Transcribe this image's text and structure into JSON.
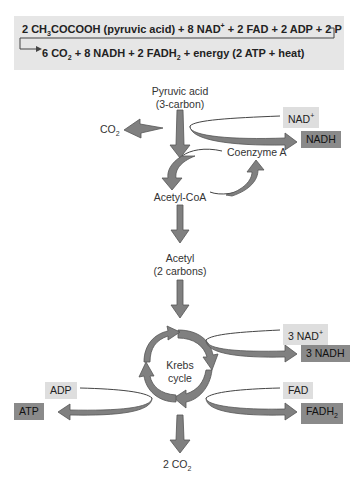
{
  "equation": {
    "line1": {
      "prefix": "2 CH",
      "sub1": "3",
      "rest": "COCOOH (pyruvic acid) + 8 NAD",
      "sup": "+",
      "tail": " + 2 FAD + 2 ADP + 2 P"
    },
    "line2": {
      "prefix": "6 CO",
      "sub1": "2",
      "mid": " + 8 NADH + 2 FADH",
      "sub2": "2",
      "tail": " + energy (2 ATP + heat)"
    }
  },
  "nodes": {
    "pyruvic_acid": "Pyruvic acid",
    "pyruvic_acid_note": "(3-carbon)",
    "co2_top": {
      "base": "CO",
      "sub": "2"
    },
    "nad_plus": {
      "base": "NAD",
      "sup": "+"
    },
    "nadh": "NADH",
    "coenzyme_a": "Coenzyme A",
    "acetyl_coa": "Acetyl-CoA",
    "acetyl": "Acetyl",
    "acetyl_note": "(2 carbons)",
    "krebs1": "Krebs",
    "krebs2": "cycle",
    "nad3": {
      "base": "3 NAD",
      "sup": "+"
    },
    "nadh3": "3 NADH",
    "fad": "FAD",
    "fadh2": {
      "base": "FADH",
      "sub": "2"
    },
    "adp": "ADP",
    "atp": "ATP",
    "co2_bottom": {
      "base": "2 CO",
      "sub": "2"
    }
  },
  "colors": {
    "arrow": "#808080",
    "arrow_stroke": "#5a5a5a",
    "light_box": "#dedede",
    "dark_box": "#8a8a8a",
    "eq_bg": "#e6e6e6"
  }
}
